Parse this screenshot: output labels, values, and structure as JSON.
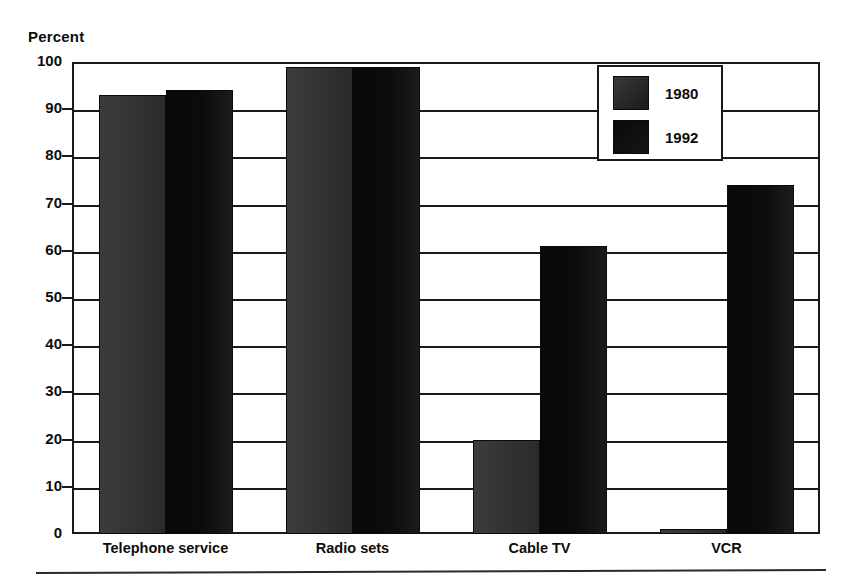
{
  "chart_data": {
    "type": "bar",
    "title": "",
    "subtitle": "",
    "xlabel": "",
    "ylabel": "Percent",
    "ylim": [
      0,
      100
    ],
    "yticks": [
      0,
      10,
      20,
      30,
      40,
      50,
      60,
      70,
      80,
      90,
      100
    ],
    "ytick_labels": [
      "0",
      "10",
      "20",
      "30",
      "40",
      "50",
      "60",
      "70",
      "80",
      "90",
      "100"
    ],
    "grid": true,
    "legend_position": "top-right",
    "categories": [
      "Telephone service",
      "Radio sets",
      "Cable TV",
      "VCR"
    ],
    "series": [
      {
        "name": "1980",
        "color": "#333333",
        "values": [
          93,
          99,
          20,
          1
        ]
      },
      {
        "name": "1992",
        "color": "#0d0d0d",
        "values": [
          94,
          99,
          61,
          74
        ]
      }
    ]
  },
  "axis": {
    "y_title": "Percent"
  },
  "legend": {
    "entries": [
      {
        "label": "1980",
        "swatch": "legend-swatch-1980"
      },
      {
        "label": "1992",
        "swatch": "legend-swatch-1992"
      }
    ]
  }
}
